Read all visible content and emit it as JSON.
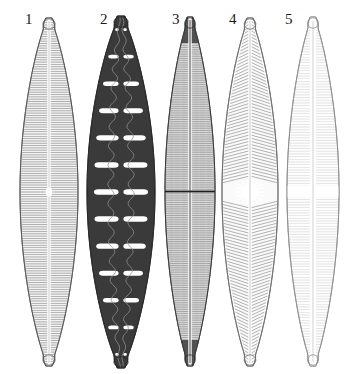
{
  "plate": {
    "title": "Diatom valve plate",
    "background_color": "#ffffff",
    "width": 345,
    "height": 374,
    "orientation": "vertical lanceolate valves in a row",
    "label_color": "#1a1a1a"
  },
  "specimens": [
    {
      "number": "1",
      "label_x": 25,
      "label_y": 12,
      "center_x": 49,
      "top_y": 18,
      "bottom_y": 366,
      "half_width": 29,
      "outline_color": "#555555",
      "fill_color": "#f2f2f2",
      "stria_color": "#7d7d7d",
      "stria_pattern": "fine-transverse-striae",
      "stria_count": 150,
      "raphe": "narrow-straight-raphe",
      "central_area": "small-elliptic",
      "apex_shape": "rounded-capitate",
      "tone": "medium-gray"
    },
    {
      "number": "2",
      "label_x": 100,
      "label_y": 12,
      "center_x": 121,
      "top_y": 16,
      "bottom_y": 368,
      "half_width": 34,
      "outline_color": "#262626",
      "fill_color": "#3a3a3a",
      "stria_color": "#ffffff",
      "stria_pattern": "large-loculi-areolae",
      "stria_count": 26,
      "raphe": "sinuous-wavy-medial-line",
      "central_area": "broad-loculate",
      "apex_shape": "rounded-subcapitate",
      "tone": "dark"
    },
    {
      "number": "3",
      "label_x": 172,
      "label_y": 12,
      "center_x": 190,
      "top_y": 17,
      "bottom_y": 366,
      "half_width": 25,
      "outline_color": "#333333",
      "fill_color": "#efefef",
      "stria_color": "#8a8a8a",
      "stria_pattern": "dense-cross-hatched-striae",
      "stria_count": 160,
      "raphe": "straight-dark-raphe",
      "central_area": "narrow-transverse-bar",
      "apex_shape": "acute-rostrate-dark",
      "tone": "medium-dark"
    },
    {
      "number": "4",
      "label_x": 229,
      "label_y": 12,
      "center_x": 250,
      "top_y": 18,
      "bottom_y": 366,
      "half_width": 28,
      "outline_color": "#6b6b6b",
      "fill_color": "#fafafa",
      "stria_color": "#9a9a9a",
      "stria_pattern": "oblique-chevron-striae",
      "stria_count": 110,
      "raphe": "fine-straight-raphe",
      "central_area": "stellate-rosette",
      "apex_shape": "rounded-capitate",
      "tone": "light-gray"
    },
    {
      "number": "5",
      "label_x": 285,
      "label_y": 12,
      "center_x": 313,
      "top_y": 17,
      "bottom_y": 366,
      "half_width": 26,
      "outline_color": "#8c8c8c",
      "fill_color": "#fdfdfd",
      "stria_color": "#c9c9c9",
      "stria_pattern": "very-fine-faint-striae",
      "stria_count": 130,
      "raphe": "narrow-straight-raphe",
      "central_area": "broad-white-fascia-cross",
      "apex_shape": "rounded-capitate",
      "tone": "very-light"
    }
  ]
}
